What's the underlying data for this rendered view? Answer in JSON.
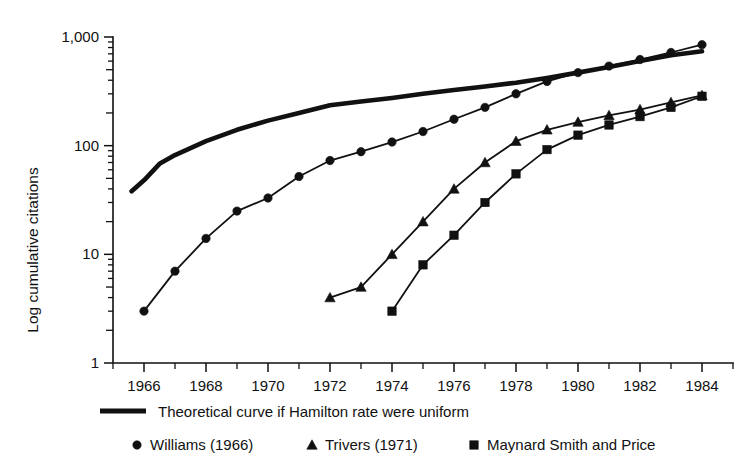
{
  "chart_data": {
    "type": "line",
    "title": "",
    "xlabel": "",
    "ylabel": "Log cumulative citations",
    "yscale": "log",
    "ylim": [
      1,
      1000
    ],
    "xlim": [
      1965,
      1985
    ],
    "grid": false,
    "legend_position": "below",
    "y_tick_labels": [
      "1,000",
      "100",
      "10",
      "1"
    ],
    "y_tick_values": [
      1000,
      100,
      10,
      1
    ],
    "x_tick_labels": [
      "1966",
      "1968",
      "1970",
      "1972",
      "1974",
      "1976",
      "1978",
      "1980",
      "1982",
      "1984"
    ],
    "x_tick_values": [
      1966,
      1968,
      1970,
      1972,
      1974,
      1976,
      1978,
      1980,
      1982,
      1984
    ],
    "x_minor_ticks": [
      1965,
      1967,
      1969,
      1971,
      1973,
      1975,
      1977,
      1979,
      1981,
      1983,
      1985
    ],
    "series": [
      {
        "name": "Theoretical curve if Hamilton rate were uniform",
        "marker": "none",
        "style": "thick-line",
        "x": [
          1965.6,
          1966,
          1966.5,
          1967,
          1968,
          1969,
          1970,
          1971,
          1972,
          1973,
          1974,
          1975,
          1976,
          1977,
          1978,
          1979,
          1980,
          1981,
          1982,
          1983,
          1984
        ],
        "values": [
          38,
          48,
          68,
          82,
          110,
          140,
          170,
          200,
          235,
          255,
          275,
          300,
          325,
          350,
          380,
          420,
          470,
          530,
          600,
          680,
          740
        ]
      },
      {
        "name": "Williams (1966)",
        "marker": "circle",
        "style": "line",
        "x": [
          1966,
          1967,
          1968,
          1969,
          1970,
          1971,
          1972,
          1973,
          1974,
          1975,
          1976,
          1977,
          1978,
          1979,
          1980,
          1981,
          1982,
          1983,
          1984
        ],
        "values": [
          3,
          7,
          14,
          25,
          33,
          52,
          73,
          88,
          108,
          135,
          175,
          225,
          300,
          390,
          470,
          540,
          620,
          720,
          850
        ]
      },
      {
        "name": "Trivers (1971)",
        "marker": "triangle",
        "style": "line",
        "x": [
          1972,
          1973,
          1974,
          1975,
          1976,
          1977,
          1978,
          1979,
          1980,
          1981,
          1982,
          1983,
          1984
        ],
        "values": [
          4,
          5,
          10,
          20,
          40,
          70,
          110,
          140,
          165,
          190,
          215,
          250,
          290
        ]
      },
      {
        "name": "Maynard Smith and Price",
        "marker": "square",
        "style": "line",
        "x": [
          1974,
          1975,
          1976,
          1977,
          1978,
          1979,
          1980,
          1981,
          1982,
          1983,
          1984
        ],
        "values": [
          3,
          8,
          15,
          30,
          55,
          92,
          125,
          155,
          185,
          225,
          285
        ]
      }
    ]
  },
  "legend": {
    "rows": [
      {
        "entries": [
          {
            "label": "Theoretical curve if Hamilton rate were uniform",
            "marker": "thick-line"
          }
        ]
      },
      {
        "entries": [
          {
            "label": "Williams (1966)",
            "marker": "circle"
          },
          {
            "label": "Trivers (1971)",
            "marker": "triangle"
          },
          {
            "label": "Maynard Smith and Price",
            "marker": "square"
          }
        ]
      }
    ]
  }
}
